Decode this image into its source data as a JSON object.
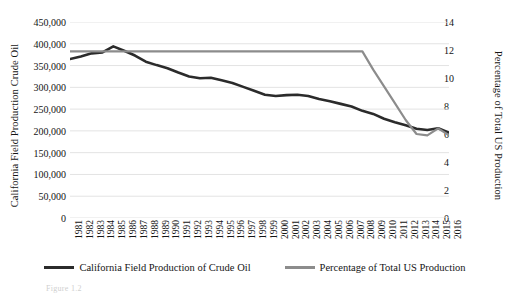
{
  "chart_data": {
    "type": "line",
    "title": "",
    "xlabel": "",
    "grid": true,
    "legend_position": "bottom",
    "x": [
      1981,
      1982,
      1983,
      1984,
      1985,
      1986,
      1987,
      1988,
      1989,
      1990,
      1991,
      1992,
      1993,
      1994,
      1995,
      1996,
      1997,
      1998,
      1999,
      2000,
      2001,
      2002,
      2003,
      2004,
      2005,
      2006,
      2007,
      2008,
      2009,
      2010,
      2011,
      2012,
      2013,
      2014,
      2015,
      2016
    ],
    "categories": [
      "1981",
      "1982",
      "1983",
      "1984",
      "1985",
      "1986",
      "1987",
      "1988",
      "1989",
      "1990",
      "1991",
      "1992",
      "1993",
      "1994",
      "1995",
      "1996",
      "1997",
      "1998",
      "1999",
      "2000",
      "2001",
      "2002",
      "2003",
      "2004",
      "2005",
      "2006",
      "2007",
      "2008",
      "2009",
      "2010",
      "2011",
      "2012",
      "2013",
      "2014",
      "2015",
      "2016"
    ],
    "series": [
      {
        "name": "California Field Production of Crude Oil",
        "axis": "left",
        "color": "#2b2b2b",
        "ylim": [
          0,
          450000
        ],
        "ytick_step": 50000,
        "values": [
          365000,
          371000,
          378000,
          380000,
          394000,
          384000,
          373000,
          359000,
          351000,
          344000,
          334000,
          325000,
          321000,
          322000,
          316000,
          310000,
          301000,
          292000,
          283000,
          280000,
          282000,
          283000,
          280000,
          273000,
          268000,
          262000,
          256000,
          246000,
          239000,
          228000,
          220000,
          213000,
          205000,
          202000,
          206000,
          196000
        ]
      },
      {
        "name": "Percentage of Total US Production",
        "axis": "right",
        "color": "#8c8c8c",
        "ylim": [
          0,
          14
        ],
        "ytick_step": 2,
        "values": [
          11.9,
          11.9,
          11.9,
          11.9,
          11.9,
          11.9,
          11.9,
          11.9,
          11.9,
          11.9,
          11.9,
          11.9,
          11.9,
          11.9,
          11.9,
          11.9,
          11.9,
          11.9,
          11.9,
          11.9,
          11.9,
          11.9,
          11.9,
          11.9,
          11.9,
          11.9,
          11.9,
          11.9,
          10.6,
          9.4,
          8.2,
          7.0,
          6.0,
          5.9,
          6.4,
          5.9
        ]
      }
    ],
    "left_axis": {
      "label": "California Field Production Crude Oil",
      "ticks": [
        "0",
        "50,000",
        "100,000",
        "150,000",
        "200,000",
        "250,000",
        "300,000",
        "350,000",
        "400,000",
        "450,000"
      ],
      "tick_values": [
        0,
        50000,
        100000,
        150000,
        200000,
        250000,
        300000,
        350000,
        400000,
        450000
      ],
      "min": 0,
      "max": 450000
    },
    "right_axis": {
      "label": "Percentage of Total US Production",
      "ticks": [
        "0",
        "2",
        "4",
        "6",
        "8",
        "10",
        "12",
        "14"
      ],
      "tick_values": [
        0,
        2,
        4,
        6,
        8,
        10,
        12,
        14
      ],
      "min": 0,
      "max": 14
    },
    "legend": [
      {
        "label": "California Field Production of Crude Oil",
        "color": "#2b2b2b",
        "width": 3
      },
      {
        "label": "Percentage of Total US Production",
        "color": "#8c8c8c",
        "width": 3
      }
    ]
  },
  "caption": "Figure 1.2"
}
